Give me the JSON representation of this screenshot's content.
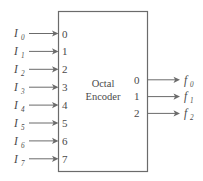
{
  "diagram": {
    "title": "Octal Encoder",
    "title_line1": "Octal",
    "title_line2": "Encoder",
    "line_color": "#6b6b6b",
    "text_color": "#4a4a4a",
    "background": "#ffffff",
    "inputs": [
      {
        "label": "I",
        "subscript": "0",
        "port": "0"
      },
      {
        "label": "I",
        "subscript": "1",
        "port": "1"
      },
      {
        "label": "I",
        "subscript": "2",
        "port": "2"
      },
      {
        "label": "I",
        "subscript": "3",
        "port": "3"
      },
      {
        "label": "I",
        "subscript": "4",
        "port": "4"
      },
      {
        "label": "I",
        "subscript": "5",
        "port": "5"
      },
      {
        "label": "I",
        "subscript": "6",
        "port": "6"
      },
      {
        "label": "I",
        "subscript": "7",
        "port": "7"
      }
    ],
    "outputs": [
      {
        "label": "f",
        "subscript": "0",
        "port": "0"
      },
      {
        "label": "f",
        "subscript": "1",
        "port": "1"
      },
      {
        "label": "f",
        "subscript": "2",
        "port": "2"
      }
    ]
  }
}
